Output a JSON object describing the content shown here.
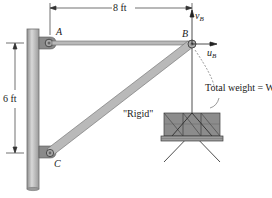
{
  "diagram": {
    "title": "",
    "dimensions": {
      "horizontal": "8 ft",
      "vertical": "6 ft"
    },
    "points": {
      "A": "A",
      "B": "B",
      "C": "C"
    },
    "axes": {
      "v": "v",
      "v_sub": "B",
      "u": "u",
      "u_sub": "B"
    },
    "labels": {
      "strut": "\"Rigid\"",
      "weight": "Total weight = W"
    },
    "colors": {
      "member_fill": "#b9b9b9",
      "member_stroke": "#6a6a6a",
      "crate_fill": "#8c8c8c",
      "crate_dark": "#3c3c3c",
      "text": "#1a1a1a"
    }
  }
}
